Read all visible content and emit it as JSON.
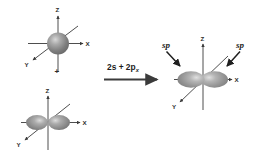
{
  "figure": {
    "background_color": "#ffffff",
    "orbital_fill_color": "#9a9a9a",
    "orbital_highlight_color": "#e3e3e3",
    "axis_color": "#3a3a3a",
    "text_color": "#1c1c1c"
  },
  "reaction": {
    "label_prefix": "2s + 2p",
    "label_subscript": "x",
    "arrow_name": "reaction-arrow",
    "plus_sign": "+"
  },
  "left": {
    "top_orbital": {
      "name": "2s",
      "shape": "sphere",
      "axes": [
        {
          "key": "z",
          "label": "Z"
        },
        {
          "key": "x",
          "label": "X"
        },
        {
          "key": "y",
          "label": "Y"
        }
      ]
    },
    "bottom_orbital": {
      "name": "2px",
      "shape": "dumbbell",
      "axes": [
        {
          "key": "z",
          "label": "Z"
        },
        {
          "key": "x",
          "label": "X"
        },
        {
          "key": "y",
          "label": "Y"
        }
      ]
    }
  },
  "right": {
    "orbital": {
      "name": "sp-hybrid",
      "shape": "two-lobe-hybrid",
      "axes": [
        {
          "key": "z",
          "label": "Z"
        },
        {
          "key": "x",
          "label": "X"
        },
        {
          "key": "y",
          "label": "Y"
        }
      ]
    },
    "labels": [
      {
        "key": "sp-left",
        "text": "sp"
      },
      {
        "key": "sp-right",
        "text": "sp"
      }
    ]
  }
}
